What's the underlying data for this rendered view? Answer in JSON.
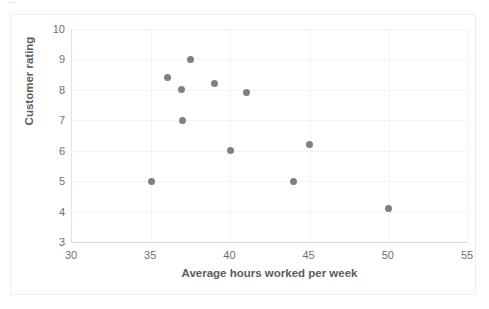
{
  "page": {
    "clipped_header_text": "..."
  },
  "chart_data": {
    "type": "scatter",
    "title": "",
    "xlabel": "Average hours worked per week",
    "ylabel": "Customer rating",
    "xlim": [
      30,
      55
    ],
    "ylim": [
      3,
      10
    ],
    "xticks": [
      30,
      35,
      40,
      45,
      50,
      55
    ],
    "yticks": [
      3,
      4,
      5,
      6,
      7,
      8,
      9,
      10
    ],
    "grid": true,
    "legend": "none",
    "marker": {
      "shape": "circle",
      "color": "#808080",
      "size_px": 7
    },
    "series": [
      {
        "name": "Employees",
        "points": [
          {
            "x": 35.0,
            "y": 5.0
          },
          {
            "x": 36.0,
            "y": 8.4
          },
          {
            "x": 36.9,
            "y": 8.0
          },
          {
            "x": 37.5,
            "y": 9.0
          },
          {
            "x": 37.0,
            "y": 7.0
          },
          {
            "x": 39.0,
            "y": 8.2
          },
          {
            "x": 40.0,
            "y": 6.0
          },
          {
            "x": 41.0,
            "y": 7.9
          },
          {
            "x": 44.0,
            "y": 5.0
          },
          {
            "x": 45.0,
            "y": 6.2
          },
          {
            "x": 50.0,
            "y": 4.1
          }
        ]
      }
    ]
  }
}
